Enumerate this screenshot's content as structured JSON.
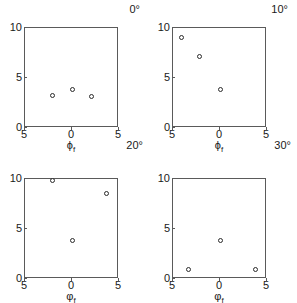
{
  "figure": {
    "title": "",
    "panels": [
      {
        "id": "panel-0deg",
        "angle_label": "0°",
        "corner_angle_label": "20°",
        "xlabel_symbol": "ϕ",
        "xlabel_sub": "f",
        "yticks": [
          "0",
          "5",
          "10"
        ],
        "xticks": [
          "5",
          "0",
          "5"
        ]
      },
      {
        "id": "panel-10deg",
        "angle_label": "10°",
        "corner_angle_label": "30°",
        "xlabel_symbol": "ϕ",
        "xlabel_sub": "f",
        "yticks": [
          "0",
          "5",
          "10"
        ],
        "xticks": [
          "5",
          "0",
          "5"
        ]
      },
      {
        "id": "panel-20deg",
        "angle_label": "",
        "corner_angle_label": "",
        "xlabel_symbol": "φ",
        "xlabel_sub": "f",
        "yticks": [
          "0",
          "5",
          "10"
        ],
        "xticks": [
          "5",
          "0",
          "5"
        ]
      },
      {
        "id": "panel-30deg",
        "angle_label": "",
        "corner_angle_label": "",
        "xlabel_symbol": "φ",
        "xlabel_sub": "f",
        "yticks": [
          "0",
          "5",
          "10"
        ],
        "xticks": [
          "5",
          "0",
          "5"
        ]
      }
    ]
  },
  "chart_data": [
    {
      "type": "scatter",
      "title": "0°",
      "xlabel": "ϕ_f",
      "ylabel": "",
      "xlim": [
        -5,
        5
      ],
      "ylim": [
        0,
        10
      ],
      "xticks": [
        -5,
        0,
        5
      ],
      "yticks": [
        0,
        5,
        10
      ],
      "xtick_labels": [
        "5",
        "0",
        "5"
      ],
      "ytick_labels": [
        "0",
        "5",
        "10"
      ],
      "grid": false,
      "legend": "none",
      "marker": "open-circle",
      "points": [
        {
          "x": -2.1,
          "y": 3.3
        },
        {
          "x": 0.0,
          "y": 3.9
        },
        {
          "x": 2.1,
          "y": 3.2
        }
      ]
    },
    {
      "type": "scatter",
      "title": "10°",
      "xlabel": "ϕ_f",
      "ylabel": "",
      "xlim": [
        -5,
        5
      ],
      "ylim": [
        0,
        10
      ],
      "xticks": [
        -5,
        0,
        5
      ],
      "yticks": [
        0,
        5,
        10
      ],
      "xtick_labels": [
        "5",
        "0",
        "5"
      ],
      "ytick_labels": [
        "0",
        "5",
        "10"
      ],
      "grid": false,
      "legend": "none",
      "marker": "open-circle",
      "points": [
        {
          "x": -4.1,
          "y": 9.1
        },
        {
          "x": -2.2,
          "y": 7.2
        },
        {
          "x": 0.1,
          "y": 3.9
        }
      ]
    },
    {
      "type": "scatter",
      "title": "20°",
      "xlabel": "φ_f",
      "ylabel": "",
      "xlim": [
        -5,
        5
      ],
      "ylim": [
        0,
        10
      ],
      "xticks": [
        -5,
        0,
        5
      ],
      "yticks": [
        0,
        5,
        10
      ],
      "xtick_labels": [
        "5",
        "0",
        "5"
      ],
      "ytick_labels": [
        "0",
        "5",
        "10"
      ],
      "grid": false,
      "legend": "none",
      "marker": "open-circle",
      "points": [
        {
          "x": -2.1,
          "y": 9.8
        },
        {
          "x": 3.7,
          "y": 8.6
        },
        {
          "x": 0.0,
          "y": 3.9
        }
      ]
    },
    {
      "type": "scatter",
      "title": "30°",
      "xlabel": "φ_f",
      "ylabel": "",
      "xlim": [
        -5,
        5
      ],
      "ylim": [
        0,
        10
      ],
      "xticks": [
        -5,
        0,
        5
      ],
      "yticks": [
        0,
        5,
        10
      ],
      "xtick_labels": [
        "5",
        "0",
        "5"
      ],
      "ytick_labels": [
        "0",
        "5",
        "10"
      ],
      "grid": false,
      "legend": "none",
      "marker": "open-circle",
      "points": [
        {
          "x": -3.4,
          "y": 1.0
        },
        {
          "x": 0.0,
          "y": 3.9
        },
        {
          "x": 3.8,
          "y": 1.0
        }
      ]
    }
  ]
}
